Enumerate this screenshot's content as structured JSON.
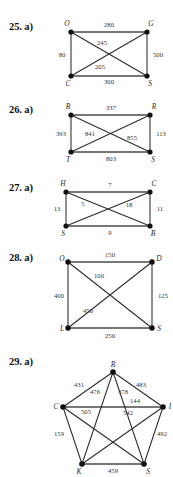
{
  "page": {
    "width": 173,
    "height": 477,
    "background": "#ffffff",
    "ink": "#1a1a1a"
  },
  "problems": [
    {
      "id": "25",
      "number_label": "25. a)",
      "shape": "square-K4",
      "vertices": [
        {
          "id": "O",
          "label": "O",
          "x": 71,
          "y": 32
        },
        {
          "id": "G",
          "label": "G",
          "x": 147,
          "y": 32
        },
        {
          "id": "C",
          "label": "C",
          "x": 71,
          "y": 76
        },
        {
          "id": "S",
          "label": "S",
          "x": 147,
          "y": 76
        }
      ],
      "edges": [
        {
          "from": "O",
          "to": "G",
          "weight": "280",
          "lx": 109,
          "ly": 25,
          "style": "thick"
        },
        {
          "from": "O",
          "to": "C",
          "weight": "80",
          "lx": 61,
          "ly": 56,
          "style": "thin"
        },
        {
          "from": "G",
          "to": "S",
          "weight": "500",
          "lx": 158,
          "ly": 56,
          "style": "thin"
        },
        {
          "from": "C",
          "to": "S",
          "weight": "300",
          "lx": 109,
          "ly": 84,
          "style": "thick"
        },
        {
          "from": "O",
          "to": "S",
          "weight": "245",
          "lx": 102,
          "ly": 43,
          "style": "thin"
        },
        {
          "from": "G",
          "to": "C",
          "weight": "205",
          "lx": 100,
          "ly": 68,
          "style": "thin"
        }
      ]
    },
    {
      "id": "26",
      "number_label": "26. a)",
      "shape": "rectangle-K4",
      "vertices": [
        {
          "id": "B",
          "label": "B",
          "x": 71,
          "y": 115
        },
        {
          "id": "R",
          "label": "R",
          "x": 150,
          "y": 115
        },
        {
          "id": "T",
          "label": "T",
          "x": 71,
          "y": 152
        },
        {
          "id": "S",
          "label": "S",
          "x": 150,
          "y": 152
        }
      ],
      "edges": [
        {
          "from": "B",
          "to": "R",
          "weight": "337",
          "lx": 111,
          "ly": 108,
          "style": "thick"
        },
        {
          "from": "B",
          "to": "T",
          "weight": "393",
          "lx": 60,
          "ly": 134,
          "style": "thin"
        },
        {
          "from": "R",
          "to": "S",
          "weight": "113",
          "lx": 160,
          "ly": 134,
          "style": "thin"
        },
        {
          "from": "T",
          "to": "S",
          "weight": "803",
          "lx": 111,
          "ly": 160,
          "style": "thick"
        },
        {
          "from": "B",
          "to": "S",
          "weight": "841",
          "lx": 89,
          "ly": 134,
          "style": "thin"
        },
        {
          "from": "R",
          "to": "T",
          "weight": "855",
          "lx": 131,
          "ly": 138,
          "style": "thin"
        }
      ]
    },
    {
      "id": "27",
      "number_label": "27. a)",
      "shape": "rectangle-K4",
      "vertices": [
        {
          "id": "H",
          "label": "H",
          "x": 66,
          "y": 192
        },
        {
          "id": "C",
          "label": "C",
          "x": 150,
          "y": 192
        },
        {
          "id": "S",
          "label": "S",
          "x": 66,
          "y": 226
        },
        {
          "id": "B",
          "label": "B",
          "x": 150,
          "y": 226
        }
      ],
      "edges": [
        {
          "from": "H",
          "to": "C",
          "weight": "7",
          "lx": 110,
          "ly": 185,
          "style": "thick"
        },
        {
          "from": "H",
          "to": "S",
          "weight": "13",
          "lx": 56,
          "ly": 210,
          "style": "thin"
        },
        {
          "from": "C",
          "to": "B",
          "weight": "11",
          "lx": 159,
          "ly": 210,
          "style": "thin"
        },
        {
          "from": "S",
          "to": "B",
          "weight": "9",
          "lx": 110,
          "ly": 234,
          "style": "thick"
        },
        {
          "from": "H",
          "to": "B",
          "weight": "5",
          "lx": 82,
          "ly": 205,
          "style": "thin"
        },
        {
          "from": "C",
          "to": "S",
          "weight": "18",
          "lx": 128,
          "ly": 206,
          "style": "thin"
        }
      ]
    },
    {
      "id": "28",
      "number_label": "28. a)",
      "shape": "square-K4",
      "vertices": [
        {
          "id": "O",
          "label": "O",
          "x": 68,
          "y": 262
        },
        {
          "id": "D",
          "label": "D",
          "x": 152,
          "y": 262
        },
        {
          "id": "L",
          "label": "L",
          "x": 68,
          "y": 328
        },
        {
          "id": "S",
          "label": "S",
          "x": 152,
          "y": 328
        }
      ],
      "edges": [
        {
          "from": "O",
          "to": "D",
          "weight": "150",
          "lx": 110,
          "ly": 255,
          "style": "thick"
        },
        {
          "from": "O",
          "to": "L",
          "weight": "400",
          "lx": 58,
          "ly": 296,
          "style": "thin"
        },
        {
          "from": "D",
          "to": "S",
          "weight": "125",
          "lx": 162,
          "ly": 296,
          "style": "thin"
        },
        {
          "from": "L",
          "to": "S",
          "weight": "250",
          "lx": 110,
          "ly": 337,
          "style": "thick"
        },
        {
          "from": "O",
          "to": "S",
          "weight": "100",
          "lx": 99,
          "ly": 276,
          "style": "thin"
        },
        {
          "from": "D",
          "to": "L",
          "weight": "450",
          "lx": 87,
          "ly": 311,
          "style": "thin"
        }
      ]
    },
    {
      "id": "29",
      "number_label": "29. a)",
      "shape": "pentagon-K5",
      "vertices": [
        {
          "id": "B",
          "label": "B",
          "x": 113,
          "y": 372
        },
        {
          "id": "I",
          "label": "I",
          "x": 163,
          "y": 407
        },
        {
          "id": "S",
          "label": "S",
          "x": 144,
          "y": 464
        },
        {
          "id": "K",
          "label": "K",
          "x": 82,
          "y": 464
        },
        {
          "id": "C",
          "label": "C",
          "x": 63,
          "y": 407
        }
      ],
      "edges": [
        {
          "from": "C",
          "to": "B",
          "weight": "431",
          "lx": 79,
          "ly": 385,
          "style": "thin"
        },
        {
          "from": "B",
          "to": "I",
          "weight": "483",
          "lx": 140,
          "ly": 385,
          "style": "thin"
        },
        {
          "from": "C",
          "to": "I",
          "weight": "144",
          "lx": 135,
          "ly": 401,
          "style": "thick"
        },
        {
          "from": "B",
          "to": "K",
          "weight": "476",
          "lx": 94,
          "ly": 392,
          "style": "thin"
        },
        {
          "from": "B",
          "to": "S",
          "weight": "378",
          "lx": 122,
          "ly": 392,
          "style": "thin"
        },
        {
          "from": "C",
          "to": "S",
          "weight": "505",
          "lx": 85,
          "ly": 410,
          "style": "thin"
        },
        {
          "from": "I",
          "to": "K",
          "weight": "542",
          "lx": 127,
          "ly": 411,
          "style": "thin"
        },
        {
          "from": "C",
          "to": "K",
          "weight": "159",
          "lx": 59,
          "ly": 434,
          "style": "thin"
        },
        {
          "from": "I",
          "to": "S",
          "weight": "492",
          "lx": 161,
          "ly": 434,
          "style": "thin"
        },
        {
          "from": "K",
          "to": "S",
          "weight": "459",
          "lx": 113,
          "ly": 472,
          "style": "thick"
        }
      ]
    }
  ]
}
